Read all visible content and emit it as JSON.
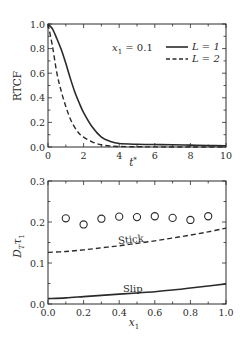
{
  "chart_data": [
    {
      "type": "line",
      "title": "",
      "xlabel": "t*",
      "ylabel": "RTCF",
      "xlim": [
        0,
        10
      ],
      "ylim": [
        0,
        1.0
      ],
      "xticks": [
        0,
        2,
        4,
        6,
        8,
        10
      ],
      "yticks": [
        0.0,
        0.2,
        0.4,
        0.6,
        0.8,
        1.0
      ],
      "xtick_labels": [
        "0",
        "2",
        "4",
        "6",
        "8",
        "10"
      ],
      "ytick_labels": [
        "0.0",
        "0.2",
        "0.4",
        "0.6",
        "0.8",
        "1.0"
      ],
      "grid": false,
      "annotation": "x₁ = 0.1",
      "legend": {
        "position": "upper right",
        "entries": [
          {
            "label": "L = 1",
            "style": "solid"
          },
          {
            "label": "L = 2",
            "style": "dashed"
          }
        ]
      },
      "series": [
        {
          "name": "L = 1",
          "style": "solid",
          "x": [
            0,
            0.25,
            0.5,
            0.75,
            1.0,
            1.25,
            1.5,
            1.75,
            2.0,
            2.5,
            3.0,
            3.5,
            4.0,
            5.0,
            6.0,
            7.0,
            8.0,
            9.0,
            10.0
          ],
          "y": [
            1.0,
            0.96,
            0.88,
            0.79,
            0.68,
            0.56,
            0.45,
            0.36,
            0.28,
            0.16,
            0.08,
            0.045,
            0.028,
            0.022,
            0.02,
            0.018,
            0.015,
            0.012,
            0.01
          ]
        },
        {
          "name": "L = 2",
          "style": "dashed",
          "x": [
            0,
            0.25,
            0.5,
            0.75,
            1.0,
            1.25,
            1.5,
            1.75,
            2.0,
            2.5,
            3.0,
            3.5,
            4.0,
            5.0,
            6.0,
            8.0,
            10.0
          ],
          "y": [
            1.0,
            0.82,
            0.6,
            0.45,
            0.33,
            0.23,
            0.16,
            0.11,
            0.08,
            0.04,
            0.018,
            0.008,
            0.004,
            0.002,
            0.001,
            0.0,
            0.0
          ]
        }
      ]
    },
    {
      "type": "line",
      "title": "",
      "xlabel": "x₁",
      "ylabel": "D_T τ_1",
      "xlim": [
        0.0,
        1.0
      ],
      "ylim": [
        0.0,
        0.3
      ],
      "xticks": [
        0.0,
        0.2,
        0.4,
        0.6,
        0.8,
        1.0
      ],
      "yticks": [
        0.0,
        0.1,
        0.2,
        0.3
      ],
      "xtick_labels": [
        "0.0",
        "0.2",
        "0.4",
        "0.6",
        "0.8",
        "1.0"
      ],
      "ytick_labels": [
        "0.0",
        "0.1",
        "0.2",
        "0.3"
      ],
      "grid": false,
      "annotations": [
        {
          "text": "Stick",
          "x": 0.5,
          "y": 0.165
        },
        {
          "text": "Slip",
          "x": 0.55,
          "y": 0.055
        }
      ],
      "series": [
        {
          "name": "Simulation",
          "style": "open-circle",
          "x": [
            0.1,
            0.2,
            0.3,
            0.4,
            0.5,
            0.6,
            0.7,
            0.8,
            0.9
          ],
          "y": [
            0.209,
            0.194,
            0.208,
            0.213,
            0.212,
            0.214,
            0.21,
            0.205,
            0.214
          ]
        },
        {
          "name": "Stick",
          "style": "dashed",
          "x": [
            0.0,
            0.1,
            0.2,
            0.3,
            0.4,
            0.5,
            0.6,
            0.7,
            0.8,
            0.9,
            1.0
          ],
          "y": [
            0.126,
            0.128,
            0.132,
            0.137,
            0.142,
            0.148,
            0.154,
            0.161,
            0.168,
            0.176,
            0.185
          ]
        },
        {
          "name": "Slip",
          "style": "solid",
          "x": [
            0.0,
            0.1,
            0.2,
            0.3,
            0.4,
            0.5,
            0.6,
            0.7,
            0.8,
            0.9,
            1.0
          ],
          "y": [
            0.013,
            0.015,
            0.018,
            0.021,
            0.024,
            0.027,
            0.03,
            0.034,
            0.039,
            0.044,
            0.049
          ]
        }
      ]
    }
  ],
  "labels": {
    "top_ylabel": "RTCF",
    "top_xlabel_main": "t",
    "top_xlabel_sup": "*",
    "top_annotation_var": "x",
    "top_annotation_sub": "1",
    "top_annotation_rest": " = 0.1",
    "legend_l1": "L = 1",
    "legend_l2": "L = 2",
    "bottom_ylabel_D": "D",
    "bottom_ylabel_T": "T",
    "bottom_ylabel_tau": "τ",
    "bottom_ylabel_1": "1",
    "bottom_xlabel_main": "x",
    "bottom_xlabel_sub": "1",
    "stick_label": "Stick",
    "slip_label": "Slip"
  },
  "colors": {
    "ink": "#2a2a2a",
    "background": "#ffffff"
  }
}
